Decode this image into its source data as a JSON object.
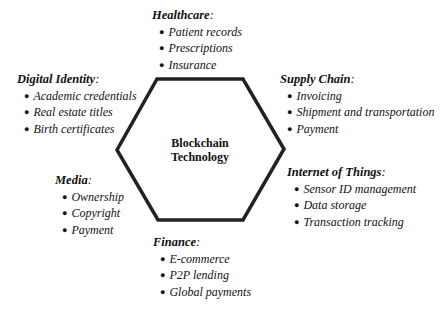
{
  "center": {
    "line1": "Blockchain",
    "line2": "Technology"
  },
  "hexagon": {
    "stroke": "#222222",
    "points": "157,79 243,79 284,149 243,220 158,220 117,150"
  },
  "groups": {
    "healthcare": {
      "title": "Healthcare",
      "colon": ":",
      "items": [
        "Patient records",
        "Prescriptions",
        "Insurance"
      ]
    },
    "digital_identity": {
      "title": "Digital Identity",
      "colon": ":",
      "items": [
        "Academic credentials",
        "Real estate titles",
        "Birth certificates"
      ]
    },
    "supply_chain": {
      "title": "Supply Chain",
      "colon": ":",
      "items": [
        "Invoicing",
        "Shipment and transportation",
        "Payment"
      ]
    },
    "iot": {
      "title": "Internet of Things",
      "colon": ":",
      "items": [
        "Sensor ID management",
        "Data storage",
        "Transaction tracking"
      ]
    },
    "media": {
      "title": "Media",
      "colon": ":",
      "items": [
        "Ownership",
        "Copyright",
        "Payment"
      ]
    },
    "finance": {
      "title": "Finance",
      "colon": ":",
      "items": [
        "E-commerce",
        "P2P lending",
        "Global payments"
      ]
    }
  },
  "bullet": "●"
}
